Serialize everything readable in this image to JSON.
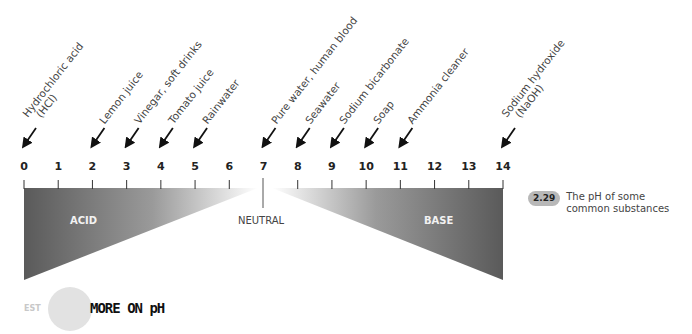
{
  "chart_data": {
    "type": "diagram",
    "title": "The pH of some common substances",
    "figure_number": "2.29",
    "axis": {
      "min": 0,
      "max": 14,
      "ticks": [
        "0",
        "1",
        "2",
        "3",
        "4",
        "5",
        "6",
        "7",
        "8",
        "9",
        "10",
        "11",
        "12",
        "13",
        "14"
      ]
    },
    "zones": {
      "acid": "ACID",
      "neutral": "NEUTRAL",
      "base": "BASE"
    },
    "substances": [
      {
        "ph": 0,
        "name": "Hydrochloric acid",
        "formula": "(HCl)"
      },
      {
        "ph": 2,
        "name": "Lemon juice"
      },
      {
        "ph": 3,
        "name": "Vinegar, soft drinks"
      },
      {
        "ph": 4,
        "name": "Tomato juice"
      },
      {
        "ph": 5,
        "name": "Rainwater"
      },
      {
        "ph": 7,
        "name": "Pure water, human blood"
      },
      {
        "ph": 8,
        "name": "Seawater"
      },
      {
        "ph": 9,
        "name": "Sodium bicarbonate"
      },
      {
        "ph": 10,
        "name": "Soap"
      },
      {
        "ph": 11,
        "name": "Ammonia cleaner"
      },
      {
        "ph": 14,
        "name": "Sodium hydroxide",
        "formula": "(NaOH)"
      }
    ]
  },
  "caption": {
    "badge": "2.29",
    "text": "The pH of some common substances"
  },
  "footer": {
    "est": "EST",
    "more_label": "MORE ON pH"
  },
  "colors": {
    "gradient_dark": "#5a5a5a",
    "gradient_light": "#ffffff",
    "badge_bg": "#b8b8b8"
  }
}
